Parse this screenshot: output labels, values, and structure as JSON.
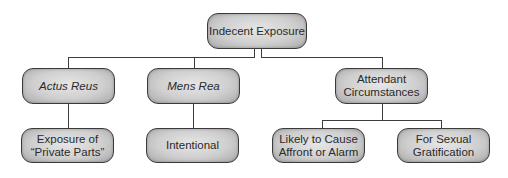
{
  "diagram": {
    "type": "tree",
    "colors": {
      "line": "#3c3c3c",
      "node_border": "#3a3a3a",
      "node_fill_light": "#e6e6e6",
      "node_fill_dark": "#a9a9a9",
      "text": "#2a2a2a"
    },
    "root": {
      "label": "Indecent Exposure"
    },
    "categories": [
      {
        "label": "Actus Reus",
        "italic": true,
        "children": [
          "Exposure of\n“Private Parts”"
        ]
      },
      {
        "label": "Mens Rea",
        "italic": true,
        "children": [
          "Intentional"
        ]
      },
      {
        "label": "Attendant\nCircumstances",
        "italic": false,
        "children": [
          "Likely to Cause\nAffront or Alarm",
          "For Sexual\nGratification"
        ]
      }
    ]
  }
}
